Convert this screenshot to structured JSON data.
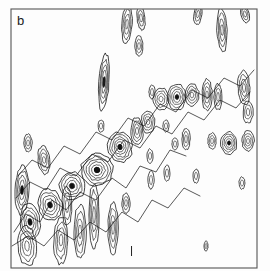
{
  "figure": {
    "panel_label": "b",
    "background_color": "#fdfdfd",
    "contour_color": "#111111",
    "frame_color": "#555555"
  },
  "chart_data": {
    "type": "contour",
    "title": "b",
    "xlabel": "",
    "ylabel": "",
    "xlim": [
      0,
      1
    ],
    "ylim": [
      0,
      1
    ],
    "grid": false,
    "legend": "none",
    "axis_ticks": {
      "bottom": [
        0.49
      ],
      "left": [],
      "top": [],
      "right": []
    },
    "plot_frame": {
      "x": 11,
      "y": 9,
      "width": 246,
      "height": 259
    },
    "contour_levels": [
      1,
      2,
      3,
      4,
      5,
      6
    ],
    "peaks": [
      {
        "cx": 245,
        "cy": 14,
        "rx": 4,
        "ry": 9,
        "rings": 3,
        "rot": -12,
        "label": ""
      },
      {
        "cx": 222,
        "cy": 30,
        "rx": 5,
        "ry": 22,
        "rings": 4,
        "rot": -3,
        "label": ""
      },
      {
        "cx": 198,
        "cy": 14,
        "rx": 4,
        "ry": 11,
        "rings": 3,
        "rot": 8,
        "label": ""
      },
      {
        "cx": 141,
        "cy": 18,
        "rx": 4,
        "ry": 12,
        "rings": 3,
        "rot": -6,
        "label": ""
      },
      {
        "cx": 127,
        "cy": 24,
        "rx": 5,
        "ry": 20,
        "rings": 4,
        "rot": 4,
        "label": ""
      },
      {
        "cx": 104,
        "cy": 82,
        "rx": 5,
        "ry": 28,
        "rings": 5,
        "rot": 4,
        "label": ""
      },
      {
        "cx": 139,
        "cy": 46,
        "rx": 4,
        "ry": 10,
        "rings": 3,
        "rot": 0,
        "label": ""
      },
      {
        "cx": 192,
        "cy": 95,
        "rx": 7,
        "ry": 11,
        "rings": 4,
        "rot": 0,
        "label": ""
      },
      {
        "cx": 177,
        "cy": 97,
        "rx": 9,
        "ry": 13,
        "rings": 5,
        "rot": 0,
        "label": ""
      },
      {
        "cx": 161,
        "cy": 99,
        "rx": 8,
        "ry": 11,
        "rings": 4,
        "rot": 0,
        "label": ""
      },
      {
        "cx": 207,
        "cy": 95,
        "rx": 5,
        "ry": 16,
        "rings": 4,
        "rot": 0,
        "label": ""
      },
      {
        "cx": 218,
        "cy": 97,
        "rx": 4,
        "ry": 13,
        "rings": 3,
        "rot": 0,
        "label": ""
      },
      {
        "cx": 152,
        "cy": 92,
        "rx": 3,
        "ry": 7,
        "rings": 2,
        "rot": 0,
        "label": ""
      },
      {
        "cx": 244,
        "cy": 88,
        "rx": 6,
        "ry": 17,
        "rings": 4,
        "rot": -4,
        "label": ""
      },
      {
        "cx": 248,
        "cy": 112,
        "rx": 5,
        "ry": 11,
        "rings": 3,
        "rot": 0,
        "label": ""
      },
      {
        "cx": 229,
        "cy": 143,
        "rx": 8,
        "ry": 11,
        "rings": 5,
        "rot": 0,
        "label": ""
      },
      {
        "cx": 248,
        "cy": 141,
        "rx": 6,
        "ry": 10,
        "rings": 4,
        "rot": 0,
        "label": ""
      },
      {
        "cx": 212,
        "cy": 141,
        "rx": 4,
        "ry": 8,
        "rings": 3,
        "rot": 0,
        "label": ""
      },
      {
        "cx": 186,
        "cy": 139,
        "rx": 4,
        "ry": 11,
        "rings": 3,
        "rot": 0,
        "label": ""
      },
      {
        "cx": 196,
        "cy": 176,
        "rx": 3,
        "ry": 7,
        "rings": 2,
        "rot": 0,
        "label": ""
      },
      {
        "cx": 167,
        "cy": 173,
        "rx": 3,
        "ry": 8,
        "rings": 2,
        "rot": 0,
        "label": ""
      },
      {
        "cx": 150,
        "cy": 156,
        "rx": 3,
        "ry": 7,
        "rings": 2,
        "rot": 0,
        "label": ""
      },
      {
        "cx": 151,
        "cy": 180,
        "rx": 3,
        "ry": 9,
        "rings": 2,
        "rot": 0,
        "label": ""
      },
      {
        "cx": 137,
        "cy": 131,
        "rx": 6,
        "ry": 14,
        "rings": 4,
        "rot": -2,
        "label": ""
      },
      {
        "cx": 120,
        "cy": 147,
        "rx": 12,
        "ry": 15,
        "rings": 6,
        "rot": -8,
        "label": ""
      },
      {
        "cx": 148,
        "cy": 122,
        "rx": 7,
        "ry": 11,
        "rings": 4,
        "rot": 0,
        "label": ""
      },
      {
        "cx": 97,
        "cy": 170,
        "rx": 16,
        "ry": 16,
        "rings": 6,
        "rot": -14,
        "label": ""
      },
      {
        "cx": 72,
        "cy": 186,
        "rx": 13,
        "ry": 14,
        "rings": 5,
        "rot": -10,
        "label": ""
      },
      {
        "cx": 50,
        "cy": 205,
        "rx": 12,
        "ry": 16,
        "rings": 5,
        "rot": -12,
        "label": ""
      },
      {
        "cx": 30,
        "cy": 222,
        "rx": 10,
        "ry": 18,
        "rings": 5,
        "rot": -8,
        "label": ""
      },
      {
        "cx": 22,
        "cy": 190,
        "rx": 7,
        "ry": 24,
        "rings": 5,
        "rot": 2,
        "label": ""
      },
      {
        "cx": 27,
        "cy": 246,
        "rx": 9,
        "ry": 20,
        "rings": 4,
        "rot": -4,
        "label": ""
      },
      {
        "cx": 61,
        "cy": 240,
        "rx": 7,
        "ry": 24,
        "rings": 4,
        "rot": 2,
        "label": ""
      },
      {
        "cx": 80,
        "cy": 232,
        "rx": 6,
        "ry": 27,
        "rings": 4,
        "rot": 0,
        "label": ""
      },
      {
        "cx": 94,
        "cy": 215,
        "rx": 5,
        "ry": 32,
        "rings": 4,
        "rot": 0,
        "label": ""
      },
      {
        "cx": 113,
        "cy": 228,
        "rx": 5,
        "ry": 26,
        "rings": 4,
        "rot": 0,
        "label": ""
      },
      {
        "cx": 67,
        "cy": 206,
        "rx": 5,
        "ry": 20,
        "rings": 3,
        "rot": 0,
        "label": ""
      },
      {
        "cx": 44,
        "cy": 160,
        "rx": 6,
        "ry": 14,
        "rings": 4,
        "rot": -6,
        "label": ""
      },
      {
        "cx": 126,
        "cy": 203,
        "rx": 4,
        "ry": 10,
        "rings": 3,
        "rot": 0,
        "label": ""
      },
      {
        "cx": 28,
        "cy": 143,
        "rx": 4,
        "ry": 9,
        "rings": 3,
        "rot": 0,
        "label": ""
      },
      {
        "cx": 242,
        "cy": 183,
        "rx": 3,
        "ry": 6,
        "rings": 2,
        "rot": 0,
        "label": ""
      },
      {
        "cx": 175,
        "cy": 144,
        "rx": 3,
        "ry": 6,
        "rings": 2,
        "rot": 0,
        "label": ""
      },
      {
        "cx": 101,
        "cy": 126,
        "rx": 3,
        "ry": 6,
        "rings": 2,
        "rot": 0,
        "label": ""
      },
      {
        "cx": 166,
        "cy": 126,
        "rx": 3,
        "ry": 6,
        "rings": 2,
        "rot": 0,
        "label": ""
      },
      {
        "cx": 206,
        "cy": 246,
        "rx": 2,
        "ry": 5,
        "rings": 2,
        "rot": 0,
        "label": ""
      }
    ],
    "ridge_strokes": [
      {
        "points": "14,232 26,214 40,222 52,200 66,210 80,192 96,200 112,178 126,188 140,166 156,172 170,150 186,156"
      },
      {
        "points": "12,246 28,236 44,246 58,230 74,240 90,222 106,232 122,212 138,222 152,200 168,208 184,188 200,196"
      },
      {
        "points": "16,198 30,182 46,190 60,168 76,176 92,154 108,162 124,140 140,148 156,126 172,134 188,112 204,120 220,100 236,108 250,92"
      },
      {
        "points": "18,176 32,160 48,168 64,146 80,154 96,132 112,140 128,118 144,126 160,104 176,112 192,90 208,98 224,78 240,86 254,70"
      }
    ]
  }
}
